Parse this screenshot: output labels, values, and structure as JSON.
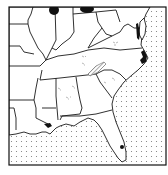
{
  "map": {
    "title": "",
    "region": "Southeastern United States",
    "legend": [],
    "symbols": {
      "ocean_pattern": "dotted",
      "occurrence_solid": "#111111",
      "occurrence_hatched": "hatched",
      "scattered_records": "small open marks"
    },
    "colors": {
      "land": "#ffffff",
      "border": "#1a1a1a",
      "ocean_dots": "#777777",
      "background": "#ffffff"
    }
  }
}
